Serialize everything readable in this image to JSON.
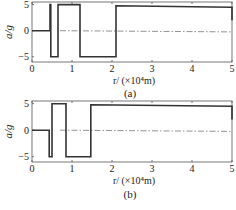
{
  "chart_data": [
    {
      "type": "line",
      "panel": "(a)",
      "caption": "(a)",
      "xlabel": "r/ (×10⁴m)",
      "ylabel": "a/g",
      "xlim": [
        0,
        5
      ],
      "ylim": [
        -6,
        5.5
      ],
      "xticks": [
        "0",
        "1",
        "2",
        "3",
        "4",
        "5"
      ],
      "yticks": [
        "5",
        "0",
        "-5"
      ],
      "grid": false,
      "reference_line": {
        "y": 0,
        "style": "dash-dot"
      },
      "series": [
        {
          "name": "a/g",
          "step": true,
          "x": [
            0,
            0.45,
            0.45,
            0.47,
            0.47,
            0.65,
            0.65,
            1.2,
            1.2,
            2.1,
            2.1,
            5.0,
            5.0
          ],
          "y": [
            0,
            0,
            5,
            5,
            -5,
            -5,
            5,
            5,
            -5,
            -5,
            4.8,
            4.5,
            2
          ]
        }
      ]
    },
    {
      "type": "line",
      "panel": "(b)",
      "caption": "(b)",
      "xlabel": "r/ (×10⁴m)",
      "ylabel": "a/g",
      "xlim": [
        0,
        5
      ],
      "ylim": [
        -6,
        5.5
      ],
      "xticks": [
        "0",
        "1",
        "2",
        "3",
        "4",
        "5"
      ],
      "yticks": [
        "5",
        "0",
        "-5"
      ],
      "grid": false,
      "reference_line": {
        "y": 0,
        "style": "dash-dot"
      },
      "series": [
        {
          "name": "a/g",
          "step": true,
          "x": [
            0,
            0.43,
            0.43,
            0.5,
            0.5,
            0.85,
            0.85,
            1.47,
            1.47,
            5.0,
            5.0
          ],
          "y": [
            0,
            0,
            -5,
            -5,
            5,
            5,
            -5,
            -5,
            4.8,
            4.5,
            2
          ]
        }
      ]
    }
  ]
}
